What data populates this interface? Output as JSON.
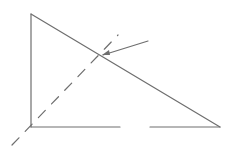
{
  "diagram": {
    "background": "#ffffff",
    "stroke_color": "#6e6e6e",
    "triangle": {
      "top_vertex": [
        31,
        14
      ],
      "bottom_left_vertex": [
        31,
        127
      ],
      "bottom_right_vertex": [
        220,
        127
      ],
      "base_gap": [
        120,
        150
      ]
    },
    "dashed_line": {
      "start": [
        12,
        145
      ],
      "end": [
        118,
        35
      ],
      "dash": "10 9"
    },
    "arrow": {
      "from": [
        148,
        41
      ],
      "to": [
        102,
        55
      ]
    },
    "intersection_point": [
      98,
      57
    ]
  }
}
